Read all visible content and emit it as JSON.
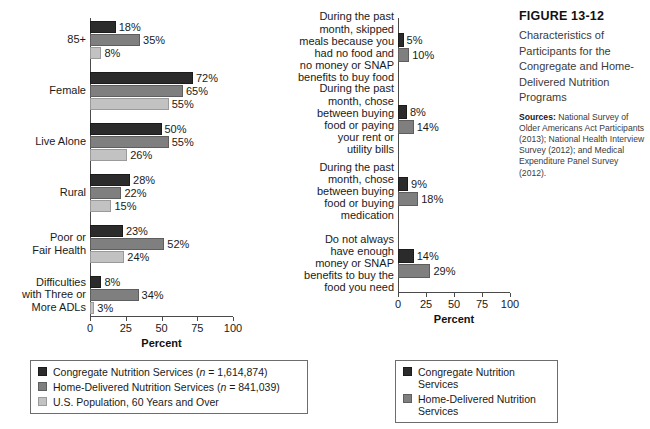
{
  "caption": {
    "figure_number": "FIGURE 13-12",
    "title": "Characteristics of Participants for the Congregate and Home-Delivered Nutrition Programs",
    "sources_label": "Sources:",
    "sources_text": " National Survey of Older Americans Act Participants (2013); National Health Interview Survey (2012); and Medical Expenditure Panel Survey (2012)."
  },
  "colors": {
    "series_congregate": "#2b2b2b",
    "series_home_delivered": "#7f7f7f",
    "series_us_population": "#c2c2c2",
    "axis": "#4a4a4a",
    "text": "#1a1a1a"
  },
  "chart_data": [
    {
      "id": "characteristics",
      "type": "bar",
      "orientation": "horizontal",
      "title": "",
      "xlabel": "Percent",
      "ylabel": "",
      "xlim": [
        0,
        100
      ],
      "xticks": [
        0,
        25,
        50,
        75,
        100
      ],
      "ticklabels": [
        "0",
        "25",
        "50",
        "75",
        "100"
      ],
      "grid": false,
      "legend_position": "bottom",
      "categories": [
        "85+",
        "Female",
        "Live Alone",
        "Rural",
        "Poor or\nFair Health",
        "Difficulties\nwith Three or\nMore ADLs"
      ],
      "series": [
        {
          "name": "Congregate Nutrition Services (n = 1,614,874)",
          "short_name": "Congregate Nutrition Services",
          "values": [
            18,
            72,
            50,
            28,
            23,
            8
          ],
          "labels": [
            "18%",
            "72%",
            "50%",
            "28%",
            "23%",
            "8%"
          ]
        },
        {
          "name": "Home-Delivered Nutrition Services (n = 841,039)",
          "short_name": "Home-Delivered Nutrition Services",
          "values": [
            35,
            65,
            55,
            22,
            52,
            34
          ],
          "labels": [
            "35%",
            "65%",
            "55%",
            "22%",
            "52%",
            "34%"
          ]
        },
        {
          "name": "U.S. Population, 60 Years and Over",
          "short_name": "U.S. Population, 60 Years and Over",
          "values": [
            8,
            55,
            26,
            15,
            24,
            3
          ],
          "labels": [
            "8%",
            "55%",
            "26%",
            "15%",
            "24%",
            "3%"
          ]
        }
      ]
    },
    {
      "id": "food-insecurity",
      "type": "bar",
      "orientation": "horizontal",
      "title": "",
      "xlabel": "Percent",
      "ylabel": "",
      "xlim": [
        0,
        100
      ],
      "xticks": [
        0,
        25,
        50,
        75,
        100
      ],
      "ticklabels": [
        "0",
        "25",
        "50",
        "75",
        "100"
      ],
      "grid": false,
      "legend_position": "bottom",
      "categories": [
        "During the past\nmonth, skipped\nmeals because you\nhad no food and\nno money or SNAP\nbenefits to buy food",
        "During the past\nmonth, chose\nbetween buying\nfood or paying\nyour rent or\nutility bills",
        "During the past\nmonth, chose\nbetween buying\nfood or buying\nmedication",
        "Do not always\nhave enough\nmoney or SNAP\nbenefits to buy the\nfood you need"
      ],
      "series": [
        {
          "name": "Congregate Nutrition Services",
          "short_name": "Congregate Nutrition Services",
          "values": [
            5,
            8,
            9,
            14
          ],
          "labels": [
            "5%",
            "8%",
            "9%",
            "14%"
          ]
        },
        {
          "name": "Home-Delivered Nutrition Services",
          "short_name": "Home-Delivered Nutrition Services",
          "values": [
            10,
            14,
            18,
            29
          ],
          "labels": [
            "10%",
            "14%",
            "18%",
            "29%"
          ]
        }
      ]
    }
  ],
  "legend_left": {
    "items": [
      {
        "label": "Congregate Nutrition Services (",
        "n_label": "n",
        "n_value": " = 1,614,874)"
      },
      {
        "label": "Home-Delivered Nutrition Services (",
        "n_label": "n",
        "n_value": " = 841,039)"
      },
      {
        "label": "U.S. Population, 60 Years and Over",
        "n_label": "",
        "n_value": ""
      }
    ]
  },
  "legend_right": {
    "items": [
      {
        "label": "Congregate Nutrition Services"
      },
      {
        "label": "Home-Delivered Nutrition Services"
      }
    ]
  }
}
